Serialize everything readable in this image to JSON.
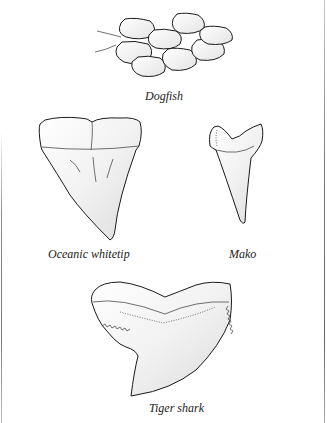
{
  "figure": {
    "specimens": [
      {
        "id": "dogfish",
        "label": "Dogfish",
        "kind": "dermal denticles (scales)"
      },
      {
        "id": "oceanic-whitetip",
        "label": "Oceanic whitetip",
        "kind": "tooth"
      },
      {
        "id": "mako",
        "label": "Mako",
        "kind": "tooth"
      },
      {
        "id": "tiger-shark",
        "label": "Tiger shark",
        "kind": "tooth"
      }
    ]
  },
  "colors": {
    "background": "#ffffff",
    "ink": "#1a1a1a",
    "shade": "#e6e6e6",
    "frame": "#777777"
  }
}
